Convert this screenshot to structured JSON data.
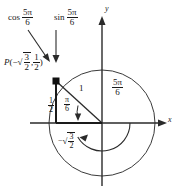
{
  "figure": {
    "type": "unit-circle-diagram",
    "background": "#ffffff",
    "stroke_color": "#1a1a1a",
    "circle": {
      "center_x": 102,
      "center_y": 123,
      "radius": 53
    },
    "point": {
      "x_px": 56,
      "y_px": 81,
      "coord_x": "-√3/2",
      "coord_y": "1/2"
    },
    "angle_deg": 150,
    "reference_angle_deg": 30
  },
  "labels": {
    "cos": {
      "fn": "cos",
      "num": "5π",
      "den": "6"
    },
    "sin": {
      "fn": "sin",
      "num": "5π",
      "den": "6"
    },
    "point": {
      "name": "P",
      "open": "(",
      "minus": "−",
      "x_num": "3",
      "x_den": "2",
      "comma": ",",
      "y_num": "1",
      "y_den": "2",
      "close": ")"
    },
    "half": {
      "num": "1",
      "den": "2"
    },
    "neg_sqrt3_over_2": {
      "minus": "−",
      "num": "3",
      "den": "2"
    },
    "pi_over_6": {
      "num": "π",
      "den": "6"
    },
    "radius": "1",
    "angle": {
      "num": "5π",
      "den": "6"
    },
    "axis_x": "x",
    "axis_y": "y",
    "radical": "√"
  }
}
